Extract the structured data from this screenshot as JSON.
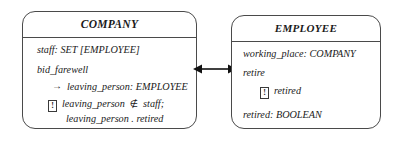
{
  "diagram": {
    "kind": "uml-class-diagram",
    "background_color": "#ffffff",
    "line_color": "#4a4a4a"
  },
  "classes": [
    {
      "id": "company",
      "name": "COMPANY",
      "attributes_and_operations": {
        "staff_line": "staff: SET [EMPLOYEE]",
        "operation_name": "bid_farewell",
        "parameter_line": "leaving_person: EMPLOYEE",
        "parameter_arrow_glyph": "→",
        "constraint_glyph": "!",
        "constraint_line_1": "leaving_person ∉ staff;",
        "constraint_line_1_prefix": "leaving_person",
        "constraint_line_1_symbol": "∉",
        "constraint_line_1_suffix": "staff;",
        "constraint_line_2": "leaving_person . retired"
      }
    },
    {
      "id": "employee",
      "name": "EMPLOYEE",
      "attributes_and_operations": {
        "working_place_line": "working_place: COMPANY",
        "operation_name": "retire",
        "constraint_glyph": "!",
        "constraint_line_1": "retired",
        "retired_line": "retired: BOOLEAN"
      }
    }
  ],
  "association": {
    "name": "company-employee-association",
    "style": "double-headed-arrow",
    "left_arrowhead": true,
    "right_arrowhead": true,
    "color": "#111111"
  }
}
